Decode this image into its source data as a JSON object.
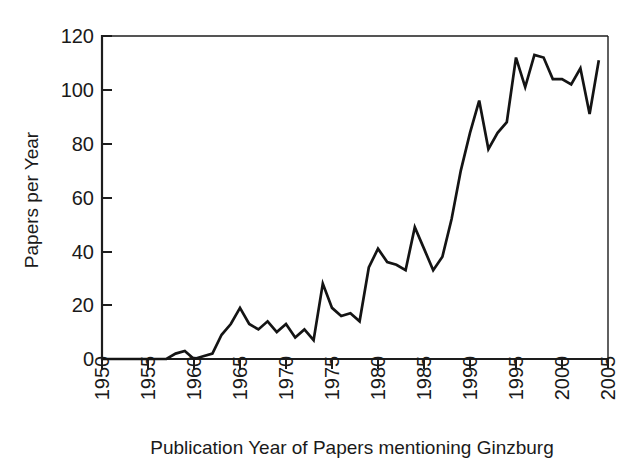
{
  "chart_data": {
    "type": "line",
    "title": "",
    "subtitle": "",
    "xlabel": "Publication Year of Papers mentioning Ginzburg",
    "ylabel": "Papers per Year",
    "xlim": [
      1950,
      2005
    ],
    "ylim": [
      0,
      120
    ],
    "grid": false,
    "legend": null,
    "x_ticks": [
      "1950",
      "1955",
      "1960",
      "1965",
      "1970",
      "1975",
      "1980",
      "1985",
      "1990",
      "1995",
      "2000",
      "2005"
    ],
    "y_ticks": [
      "0",
      "20",
      "40",
      "60",
      "80",
      "100",
      "120"
    ],
    "line_color": "#141414",
    "x": [
      1950,
      1951,
      1952,
      1953,
      1954,
      1955,
      1956,
      1957,
      1958,
      1959,
      1960,
      1961,
      1962,
      1963,
      1964,
      1965,
      1966,
      1967,
      1968,
      1969,
      1970,
      1971,
      1972,
      1973,
      1974,
      1975,
      1976,
      1977,
      1978,
      1979,
      1980,
      1981,
      1982,
      1983,
      1984,
      1985,
      1986,
      1987,
      1988,
      1989,
      1990,
      1991,
      1992,
      1993,
      1994,
      1995,
      1996,
      1997,
      1998,
      1999,
      2000,
      2001,
      2002,
      2003,
      2004
    ],
    "values": [
      0,
      0,
      0,
      0,
      0,
      0,
      0,
      0,
      2,
      3,
      0,
      1,
      2,
      9,
      13,
      19,
      13,
      11,
      14,
      10,
      13,
      8,
      11,
      7,
      28,
      19,
      16,
      17,
      14,
      34,
      41,
      36,
      35,
      33,
      49,
      41,
      33,
      38,
      52,
      70,
      84,
      96,
      78,
      84,
      88,
      112,
      101,
      113,
      112,
      104,
      104,
      102,
      108,
      91,
      111
    ],
    "series": [
      {
        "name": "Papers per Year",
        "values": [
          0,
          0,
          0,
          0,
          0,
          0,
          0,
          0,
          2,
          3,
          0,
          1,
          2,
          9,
          13,
          19,
          13,
          11,
          14,
          10,
          13,
          8,
          11,
          7,
          28,
          19,
          16,
          17,
          14,
          34,
          41,
          36,
          35,
          33,
          49,
          41,
          33,
          38,
          52,
          70,
          84,
          96,
          78,
          84,
          88,
          112,
          101,
          113,
          112,
          104,
          104,
          102,
          108,
          91,
          111
        ]
      }
    ]
  }
}
